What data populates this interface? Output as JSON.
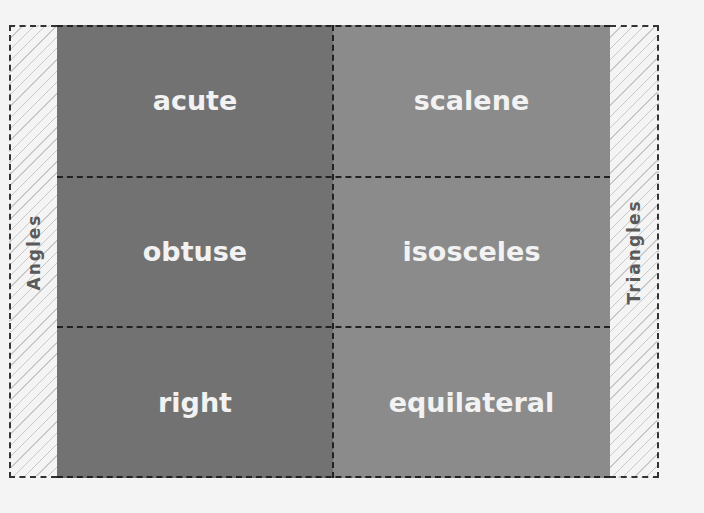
{
  "diagram": {
    "left_label": "Angles",
    "right_label": "Triangles",
    "columns": [
      {
        "name": "Angles",
        "color": "#727272",
        "items": [
          "acute",
          "obtuse",
          "right"
        ]
      },
      {
        "name": "Triangles",
        "color": "#8b8b8b",
        "items": [
          "scalene",
          "isosceles",
          "equilateral"
        ]
      }
    ]
  }
}
